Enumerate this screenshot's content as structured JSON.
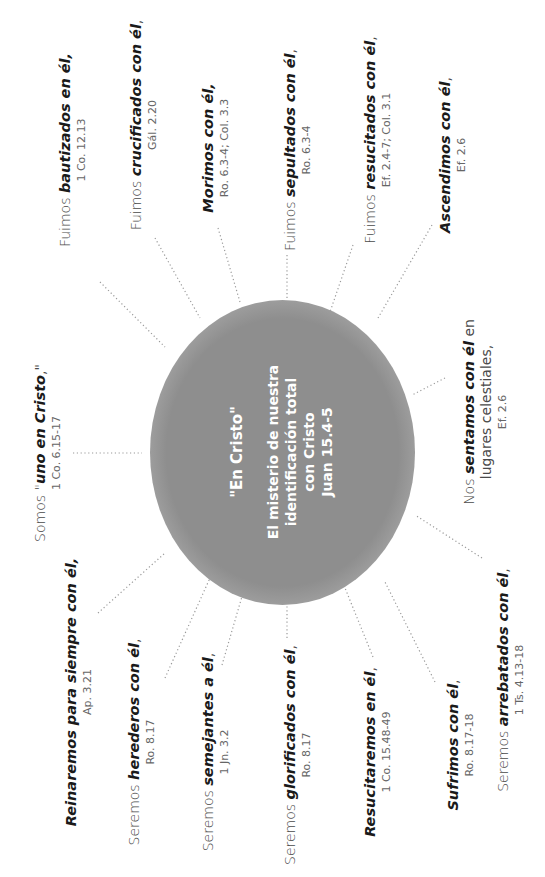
{
  "center": {
    "title": "\"En Cristo\"",
    "lines": [
      "El misterio de nuestra",
      "identificación total",
      "con Cristo",
      "Juan 15.4-5"
    ]
  },
  "labels": [
    {
      "lead": "Fuimos ",
      "em": "bautizados en él,",
      "rest": "",
      "extra": "",
      "ref": "1 Co. 12.13"
    },
    {
      "lead": "Fuimos ",
      "em": "crucificados con él",
      "rest": ",",
      "extra": "",
      "ref": "Gál. 2.20"
    },
    {
      "lead": "",
      "em": "Morimos con él,",
      "rest": "",
      "extra": "",
      "ref": "Ro. 6.3-4; Col. 3.3"
    },
    {
      "lead": "Fuimos ",
      "em": "sepultados con él",
      "rest": ",",
      "extra": "",
      "ref": "Ro. 6.3-4"
    },
    {
      "lead": "Fuimos ",
      "em": "resucitados con él",
      "rest": ",",
      "extra": "",
      "ref": "Ef. 2.4-7; Col. 3.1"
    },
    {
      "lead": "",
      "em": "Ascendimos con él",
      "rest": ",",
      "extra": "",
      "ref": "Ef. 2.6"
    },
    {
      "lead": "Nos ",
      "em": "sentamos con él",
      "rest": " en",
      "extra": "lugares celestiales,",
      "ref": "Ef. 2.6"
    },
    {
      "lead": "Seremos ",
      "em": "arrebatados con él",
      "rest": ",",
      "extra": "",
      "ref": "1 Ts. 4.13-18"
    },
    {
      "lead": "",
      "em": "Sufrimos con él",
      "rest": ",",
      "extra": "",
      "ref": "Ro. 8.17-18"
    },
    {
      "lead": "",
      "em": "Resucitaremos en él",
      "rest": ",",
      "extra": "",
      "ref": "1 Co. 15.48-49"
    },
    {
      "lead": "Seremos ",
      "em": "glorificados con él",
      "rest": ",",
      "extra": "",
      "ref": "Ro. 8.17"
    },
    {
      "lead": "Seremos ",
      "em": "semejantes a él",
      "rest": ",",
      "extra": "",
      "ref": "1 Jn. 3.2"
    },
    {
      "lead": "Seremos ",
      "em": "herederos con él",
      "rest": ",",
      "extra": "",
      "ref": "Ro. 8.17"
    },
    {
      "lead": "",
      "em": "Reinaremos para siempre con él,",
      "rest": "",
      "extra": "",
      "ref": "Ap. 3.21"
    },
    {
      "lead": "Somos \"",
      "em": "uno en Cristo",
      "rest": ",\"",
      "extra": "",
      "ref": "1 Co. 6.15-17"
    }
  ]
}
